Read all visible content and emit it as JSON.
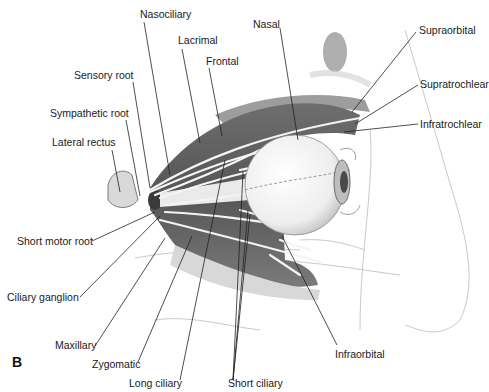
{
  "figure": {
    "panel_letter": "B",
    "labels": {
      "nasociliary": "Nasociliary",
      "lacrimal": "Lacrimal",
      "frontal": "Frontal",
      "nasal": "Nasal",
      "sensory_root": "Sensory root",
      "sympathetic_root": "Sympathetic root",
      "lateral_rectus": "Lateral rectus",
      "supraorbital": "Supraorbital",
      "supratrochlear": "Supratrochlear",
      "infratrochlear": "Infratrochlear",
      "short_motor_root": "Short motor root",
      "ciliary_ganglion": "Ciliary ganglion",
      "maxillary": "Maxillary",
      "zygomatic": "Zygomatic",
      "long_ciliary": "Long ciliary",
      "short_ciliary": "Short ciliary",
      "infraorbital": "Infraorbital"
    },
    "colors": {
      "background": "#ffffff",
      "muscle_dark": "#5a5a5a",
      "muscle_mid": "#8a8a8a",
      "nerve": "#f4f4f4",
      "line": "#222222",
      "sketch": "#c8c8c8"
    }
  }
}
